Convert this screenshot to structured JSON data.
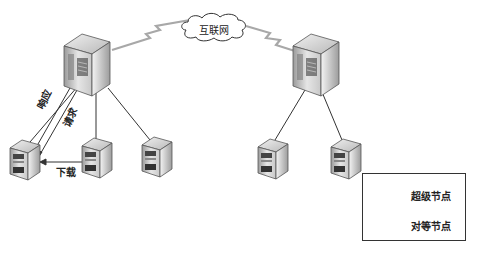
{
  "diagram": {
    "cloud": {
      "label": "互联网"
    },
    "links": {
      "response": "响应",
      "request": "请求",
      "download": "下载"
    },
    "legend": {
      "items": [
        {
          "icon": "super-node-icon",
          "label": "超级节点"
        },
        {
          "icon": "peer-node-icon",
          "label": "对等节点"
        }
      ]
    },
    "nodes": {
      "super": [
        {
          "id": "super-left"
        },
        {
          "id": "super-right"
        }
      ],
      "peers": [
        {
          "id": "peer-left-1",
          "parent": "super-left"
        },
        {
          "id": "peer-left-2",
          "parent": "super-left"
        },
        {
          "id": "peer-left-3",
          "parent": "super-left"
        },
        {
          "id": "peer-right-1",
          "parent": "super-right"
        },
        {
          "id": "peer-right-2",
          "parent": "super-right"
        }
      ]
    },
    "colors": {
      "line": "#333333",
      "wan_link": "#a8a8a8",
      "server_light": "#e8e8e8",
      "server_dark": "#6a6a6a"
    }
  }
}
